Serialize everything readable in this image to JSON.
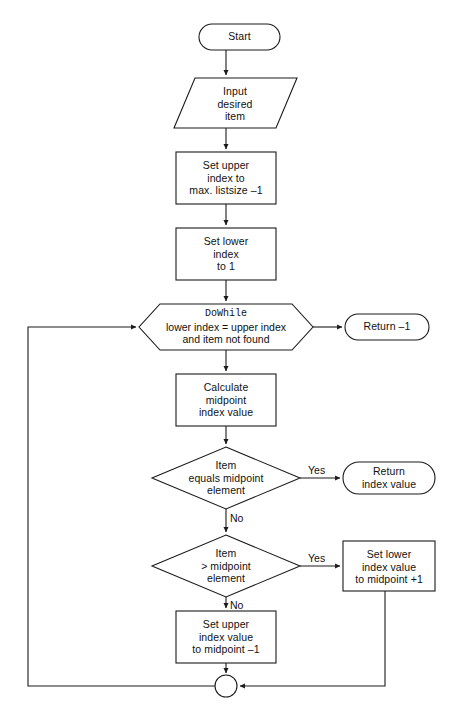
{
  "diagram": {
    "background_color": "#ffffff",
    "stroke_color": "#1a1a1a",
    "fill_color": "#ffffff",
    "text_color": "#111111"
  },
  "nodes": {
    "start": {
      "shape": "terminator",
      "label": "Start"
    },
    "input_item": {
      "shape": "parallelogram",
      "line1": "Input",
      "line2": "desired",
      "line3": "item"
    },
    "set_upper": {
      "shape": "process",
      "line1": "Set upper",
      "line2": "index to",
      "line3": "max. listsize –1"
    },
    "set_lower": {
      "shape": "process",
      "line1": "Set lower",
      "line2": "index",
      "line3": "to 1"
    },
    "dowhile": {
      "shape": "hexagon",
      "line1": "DoWhile",
      "line2": "lower index = upper index",
      "line3": "and item not found"
    },
    "return_minus_one": {
      "shape": "terminator",
      "label": "Return –1"
    },
    "calc_midpoint": {
      "shape": "process",
      "line1": "Calculate",
      "line2": "midpoint",
      "line3": "index value"
    },
    "item_equals": {
      "shape": "decision",
      "line1": "Item",
      "line2": "equals midpoint",
      "line3": "element"
    },
    "return_index": {
      "shape": "terminator",
      "line1": "Return",
      "line2": "index value"
    },
    "item_greater": {
      "shape": "decision",
      "line1": "Item",
      "line2": "> midpoint",
      "line3": "element"
    },
    "set_lower_value": {
      "shape": "process",
      "line1": "Set lower",
      "line2": "index value",
      "line3": "to midpoint +1"
    },
    "set_upper_value": {
      "shape": "process",
      "line1": "Set upper",
      "line2": "index value",
      "line3": "to midpoint –1"
    },
    "junction": {
      "shape": "connector-circle",
      "label": ""
    }
  },
  "edge_labels": {
    "equals_yes": "Yes",
    "equals_no": "No",
    "greater_yes": "Yes",
    "greater_no": "No"
  }
}
